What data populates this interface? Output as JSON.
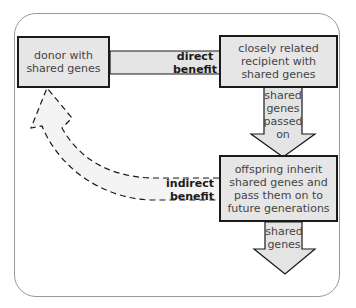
{
  "diagram": {
    "type": "flowchart",
    "nodes": {
      "donor": {
        "label": "donor with shared genes"
      },
      "recipient": {
        "label": "closely related recipient with shared genes"
      },
      "offspring": {
        "label": "offspring inherit shared genes and pass them on to future generations"
      }
    },
    "edges": {
      "direct": {
        "label_line1": "direct",
        "label_line2": "benefit",
        "from": "donor",
        "to": "recipient",
        "style": "solid"
      },
      "passed_on": {
        "label_line1": "shared",
        "label_line2": "genes",
        "label_line3": "passed",
        "label_line4": "on",
        "from": "recipient",
        "to": "offspring",
        "style": "solid"
      },
      "indirect": {
        "label_line1": "indirect",
        "label_line2": "benefit",
        "from": "offspring",
        "to": "donor",
        "style": "dashed"
      },
      "onward": {
        "label_line1": "shared",
        "label_line2": "genes",
        "from": "offspring",
        "to": "future",
        "style": "solid"
      }
    },
    "colors": {
      "box_fill": "#e6e6e6",
      "arrow_fill": "#e4e4e4",
      "dashed_fill": "#f4f4f4",
      "stroke": "#1a1a1a",
      "frame": "#9a9a9a"
    }
  }
}
